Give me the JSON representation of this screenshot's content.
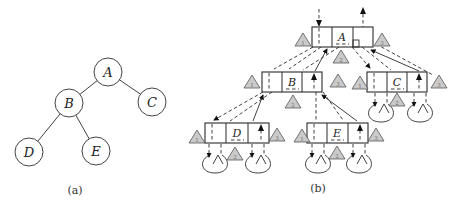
{
  "figure": {
    "panel_a": {
      "caption": "(a)",
      "nodes": {
        "root": "A",
        "left": "B",
        "right": "C",
        "left_left": "D",
        "left_right": "E"
      },
      "edges": [
        "A-B",
        "A-C",
        "B-D",
        "B-E"
      ]
    },
    "panel_b": {
      "caption": "(b)",
      "nodes": {
        "a": "A",
        "b": "B",
        "c": "C",
        "d": "D",
        "e": "E"
      },
      "visit_markers": {
        "left": "1",
        "mid": "2",
        "right": "3"
      }
    }
  }
}
